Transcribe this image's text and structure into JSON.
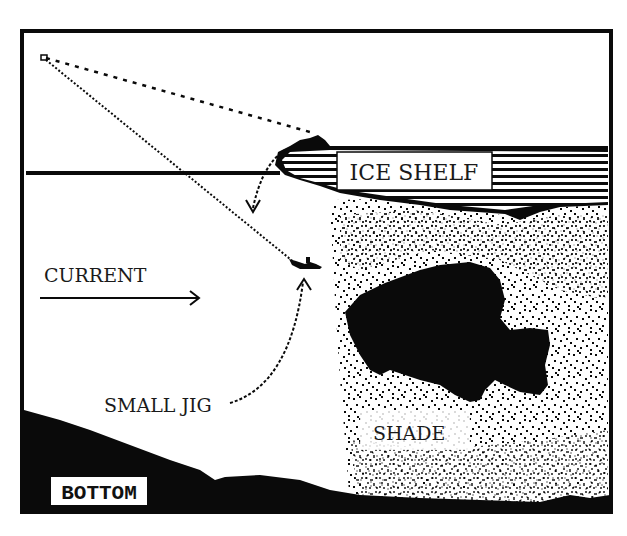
{
  "diagram": {
    "title": "",
    "colors": {
      "ink": "#0a0a0a",
      "paper": "#ffffff",
      "text": "#1a1a1a"
    },
    "labels": {
      "ice_shelf": "ICE SHELF",
      "current": "CURRENT",
      "small_jig": "SMALL JIG",
      "shade": "SHADE",
      "bottom": "BOTTOM"
    },
    "elements": [
      {
        "id": "ice-shelf",
        "type": "hatched-shape",
        "label": "ICE SHELF"
      },
      {
        "id": "water-surface",
        "type": "line"
      },
      {
        "id": "fishing-line-dashed",
        "type": "dotted-line",
        "from": "rod-tip",
        "to": "ice-shelf-edge"
      },
      {
        "id": "fishing-line-to-jig",
        "type": "dotted-line",
        "from": "rod-tip",
        "to": "small-jig"
      },
      {
        "id": "current-arrow",
        "type": "arrow",
        "label": "CURRENT",
        "direction": "right"
      },
      {
        "id": "drop-arrow",
        "type": "curved-arrow",
        "direction": "down"
      },
      {
        "id": "jig-pointer",
        "type": "curved-arrow",
        "from": "SMALL JIG label",
        "to": "small-jig"
      },
      {
        "id": "shade-region",
        "type": "stippled-region",
        "label": "SHADE"
      },
      {
        "id": "fish",
        "type": "silhouette",
        "species": "panfish"
      },
      {
        "id": "bottom",
        "type": "filled-terrain",
        "label": "BOTTOM"
      }
    ]
  }
}
